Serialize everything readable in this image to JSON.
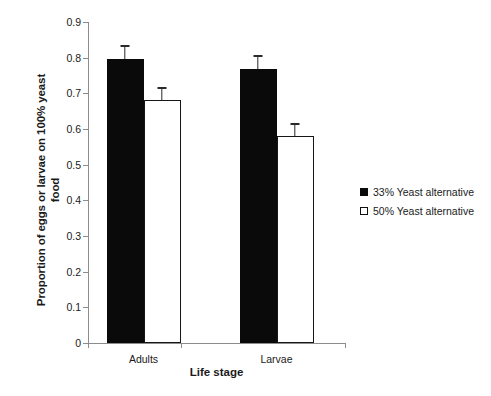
{
  "chart_data": {
    "type": "bar",
    "title": "",
    "xlabel": "Life stage",
    "ylabel": "Proportion of eggs or larvae on 100% yeast food",
    "ylabel_line1": "Proportion of eggs or larvae on 100% yeast",
    "ylabel_line2": "food",
    "categories": [
      "Adults",
      "Larvae"
    ],
    "ylim": [
      0,
      0.9
    ],
    "ytick_step": 0.1,
    "ytick_labels": [
      "0.9",
      "0.8",
      "0.7",
      "0.6",
      "0.5",
      "0.4",
      "0.3",
      "0.2",
      "0.1",
      "0"
    ],
    "ytick_values": [
      0.9,
      0.8,
      0.7,
      0.6,
      0.5,
      0.4,
      0.3,
      0.2,
      0.1,
      0
    ],
    "grid": false,
    "legend_position": "right",
    "series": [
      {
        "name": "33% Yeast alternative",
        "style": "filled",
        "color": "#0a0a0a",
        "values": [
          0.795,
          0.767
        ],
        "errors": [
          0.04,
          0.04
        ]
      },
      {
        "name": "50% Yeast alternative",
        "style": "open",
        "color": "#ffffff",
        "edgecolor": "#161616",
        "values": [
          0.68,
          0.58
        ],
        "errors": [
          0.037,
          0.036
        ]
      }
    ]
  },
  "legend": {
    "items": [
      {
        "label": "33% Yeast alternative",
        "style": "filled"
      },
      {
        "label": "50% Yeast alternative",
        "style": "open"
      }
    ]
  }
}
